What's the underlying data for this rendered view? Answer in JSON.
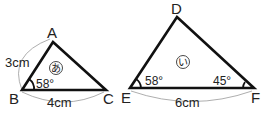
{
  "triangle1": {
    "id_label": "あ",
    "vertices": {
      "A": "A",
      "B": "B",
      "C": "C"
    },
    "side_AB": "3cm",
    "side_BC": "4cm",
    "angle_B": "58°"
  },
  "triangle2": {
    "id_label": "い",
    "vertices": {
      "D": "D",
      "E": "E",
      "F": "F"
    },
    "side_EF": "6cm",
    "angle_E": "58°",
    "angle_F": "45°"
  }
}
